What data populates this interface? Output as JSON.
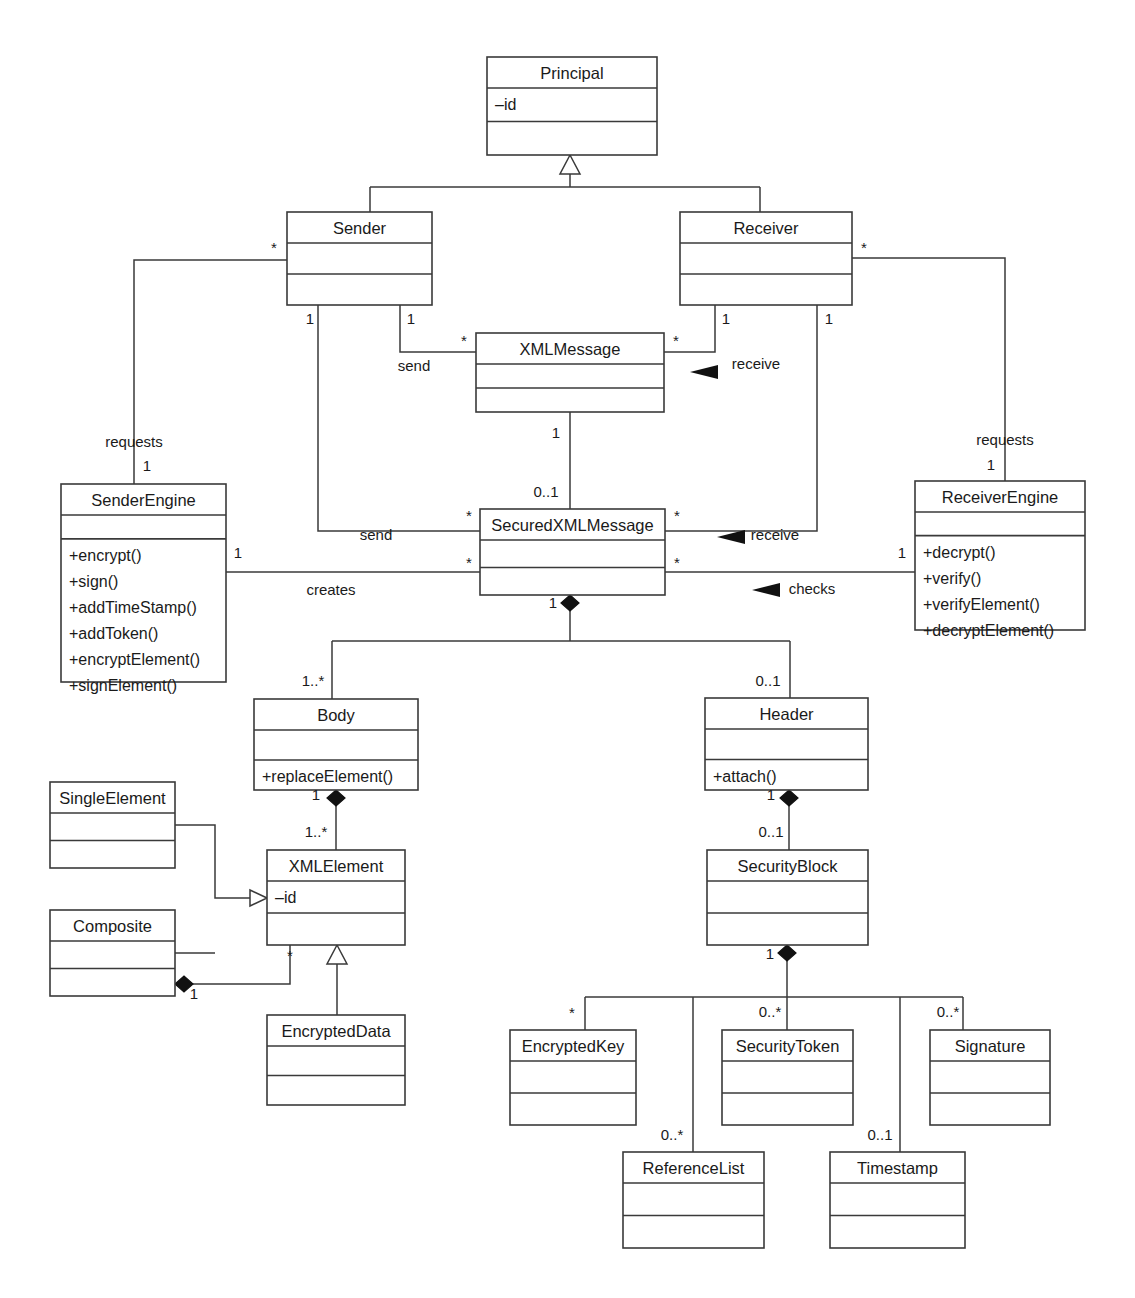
{
  "diagram": {
    "classes": [
      {
        "id": "principal",
        "name": "Principal",
        "attrs": [
          "–id"
        ],
        "ops": [],
        "x": 487,
        "y": 57,
        "w": 170,
        "h": 98
      },
      {
        "id": "sender",
        "name": "Sender",
        "attrs": [],
        "ops": [],
        "x": 287,
        "y": 212,
        "w": 145,
        "h": 93
      },
      {
        "id": "receiver",
        "name": "Receiver",
        "attrs": [],
        "ops": [],
        "x": 680,
        "y": 212,
        "w": 172,
        "h": 93
      },
      {
        "id": "xmlmessage",
        "name": "XMLMessage",
        "attrs": [],
        "ops": [],
        "x": 476,
        "y": 333,
        "w": 188,
        "h": 79
      },
      {
        "id": "senderengine",
        "name": "SenderEngine",
        "attrs": [],
        "ops": [
          "+encrypt()",
          "+sign()",
          "+addTimeStamp()",
          "+addToken()",
          "+encryptElement()",
          "+signElement()"
        ],
        "x": 61,
        "y": 484,
        "w": 165,
        "h": 198
      },
      {
        "id": "securedxml",
        "name": "SecuredXMLMessage",
        "attrs": [],
        "ops": [],
        "x": 480,
        "y": 509,
        "w": 185,
        "h": 86
      },
      {
        "id": "receiverengine",
        "name": "ReceiverEngine",
        "attrs": [],
        "ops": [
          "+decrypt()",
          "+verify()",
          "+verifyElement()",
          "+decryptElement()"
        ],
        "x": 915,
        "y": 481,
        "w": 170,
        "h": 149
      },
      {
        "id": "body",
        "name": "Body",
        "attrs": [],
        "ops": [
          "+replaceElement()"
        ],
        "x": 254,
        "y": 699,
        "w": 164,
        "h": 91
      },
      {
        "id": "header",
        "name": "Header",
        "attrs": [],
        "ops": [
          "+attach()"
        ],
        "x": 705,
        "y": 698,
        "w": 163,
        "h": 92
      },
      {
        "id": "singleelement",
        "name": "SingleElement",
        "attrs": [],
        "ops": [],
        "x": 50,
        "y": 782,
        "w": 125,
        "h": 86
      },
      {
        "id": "xmlelement",
        "name": "XMLElement",
        "attrs": [
          "–id"
        ],
        "ops": [],
        "x": 267,
        "y": 850,
        "w": 138,
        "h": 95
      },
      {
        "id": "securityblock",
        "name": "SecurityBlock",
        "attrs": [],
        "ops": [],
        "x": 707,
        "y": 850,
        "w": 161,
        "h": 95
      },
      {
        "id": "composite",
        "name": "Composite",
        "attrs": [],
        "ops": [],
        "x": 50,
        "y": 910,
        "w": 125,
        "h": 86
      },
      {
        "id": "encrypteddata",
        "name": "EncryptedData",
        "attrs": [],
        "ops": [],
        "x": 267,
        "y": 1015,
        "w": 138,
        "h": 90
      },
      {
        "id": "encryptedkey",
        "name": "EncryptedKey",
        "attrs": [],
        "ops": [],
        "x": 510,
        "y": 1030,
        "w": 126,
        "h": 95
      },
      {
        "id": "securitytoken",
        "name": "SecurityToken",
        "attrs": [],
        "ops": [],
        "x": 722,
        "y": 1030,
        "w": 131,
        "h": 95
      },
      {
        "id": "signature",
        "name": "Signature",
        "attrs": [],
        "ops": [],
        "x": 930,
        "y": 1030,
        "w": 120,
        "h": 95
      },
      {
        "id": "referencelist",
        "name": "ReferenceList",
        "attrs": [],
        "ops": [],
        "x": 623,
        "y": 1152,
        "w": 141,
        "h": 96
      },
      {
        "id": "timestamp",
        "name": "Timestamp",
        "attrs": [],
        "ops": [],
        "x": 830,
        "y": 1152,
        "w": 135,
        "h": 96
      }
    ],
    "role_labels": [
      {
        "id": "role-send-xml",
        "text": "send",
        "x": 414,
        "y": 371
      },
      {
        "id": "role-receive-xml",
        "text": "receive",
        "x": 756,
        "y": 369
      },
      {
        "id": "role-requests-left",
        "text": "requests",
        "x": 134,
        "y": 447
      },
      {
        "id": "role-requests-right",
        "text": "requests",
        "x": 1005,
        "y": 445
      },
      {
        "id": "role-send-secured",
        "text": "send",
        "x": 376,
        "y": 540
      },
      {
        "id": "role-receive-secured",
        "text": "receive",
        "x": 775,
        "y": 540
      },
      {
        "id": "role-creates",
        "text": "creates",
        "x": 331,
        "y": 595
      },
      {
        "id": "role-checks",
        "text": "checks",
        "x": 812,
        "y": 594
      }
    ],
    "multiplicities": [
      {
        "id": "m-sender-left",
        "text": "*",
        "x": 274,
        "y": 253
      },
      {
        "id": "m-receiver-right",
        "text": "*",
        "x": 864,
        "y": 253
      },
      {
        "id": "m-sender-b1",
        "text": "1",
        "x": 310,
        "y": 324
      },
      {
        "id": "m-sender-b2",
        "text": "1",
        "x": 411,
        "y": 324
      },
      {
        "id": "m-receiver-b1",
        "text": "1",
        "x": 726,
        "y": 324
      },
      {
        "id": "m-receiver-b2",
        "text": "1",
        "x": 829,
        "y": 324
      },
      {
        "id": "m-xml-left",
        "text": "*",
        "x": 464,
        "y": 346
      },
      {
        "id": "m-xml-right",
        "text": "*",
        "x": 676,
        "y": 346
      },
      {
        "id": "m-xml-bottom",
        "text": "1",
        "x": 556,
        "y": 438
      },
      {
        "id": "m-secured-top",
        "text": "0..1",
        "x": 546,
        "y": 497
      },
      {
        "id": "m-senderengine-top",
        "text": "1",
        "x": 147,
        "y": 471
      },
      {
        "id": "m-receiverengine-top",
        "text": "1",
        "x": 991,
        "y": 470
      },
      {
        "id": "m-secured-l1",
        "text": "*",
        "x": 469,
        "y": 521
      },
      {
        "id": "m-secured-r1",
        "text": "*",
        "x": 677,
        "y": 521
      },
      {
        "id": "m-secured-l2",
        "text": "*",
        "x": 469,
        "y": 568
      },
      {
        "id": "m-secured-r2",
        "text": "*",
        "x": 677,
        "y": 568
      },
      {
        "id": "m-senderengine-r",
        "text": "1",
        "x": 238,
        "y": 558
      },
      {
        "id": "m-receiverengine-l",
        "text": "1",
        "x": 902,
        "y": 558
      },
      {
        "id": "m-secured-bottom",
        "text": "1",
        "x": 553,
        "y": 608
      },
      {
        "id": "m-body-top",
        "text": "1..*",
        "x": 313,
        "y": 686
      },
      {
        "id": "m-header-top",
        "text": "0..1",
        "x": 768,
        "y": 686
      },
      {
        "id": "m-body-bottom",
        "text": "1",
        "x": 316,
        "y": 800
      },
      {
        "id": "m-header-bottom",
        "text": "1",
        "x": 771,
        "y": 800
      },
      {
        "id": "m-xmlelement-top",
        "text": "1..*",
        "x": 316,
        "y": 837
      },
      {
        "id": "m-securityblock-top",
        "text": "0..1",
        "x": 771,
        "y": 837
      },
      {
        "id": "m-xmlelement-bl",
        "text": "*",
        "x": 290,
        "y": 961
      },
      {
        "id": "m-composite-d",
        "text": "1",
        "x": 194,
        "y": 999
      },
      {
        "id": "m-securityblock-b",
        "text": "1",
        "x": 770,
        "y": 959
      },
      {
        "id": "m-encryptedkey",
        "text": "*",
        "x": 572,
        "y": 1018
      },
      {
        "id": "m-securitytoken",
        "text": "0..*",
        "x": 770,
        "y": 1017
      },
      {
        "id": "m-signature",
        "text": "0..*",
        "x": 948,
        "y": 1017
      },
      {
        "id": "m-referencelist",
        "text": "0..*",
        "x": 672,
        "y": 1140
      },
      {
        "id": "m-timestamp",
        "text": "0..1",
        "x": 880,
        "y": 1140
      }
    ]
  }
}
